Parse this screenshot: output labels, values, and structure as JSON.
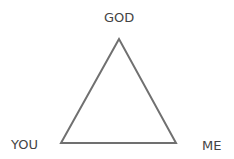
{
  "diagram": {
    "type": "triangle",
    "stroke_color": "#707070",
    "vertices": {
      "top": {
        "label": "GOD"
      },
      "bottom_left": {
        "label": "YOU"
      },
      "bottom_right": {
        "label": "ME"
      }
    }
  }
}
